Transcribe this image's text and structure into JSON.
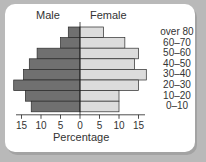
{
  "chart_data": {
    "type": "bar",
    "subtype": "population-pyramid",
    "title": "",
    "headers": {
      "left": "Male",
      "right": "Female"
    },
    "categories": [
      "over 80",
      "60–70",
      "50–60",
      "40–50",
      "30–40",
      "20–30",
      "10–20",
      "0–10"
    ],
    "series": [
      {
        "name": "Male",
        "values": [
          3,
          5,
          11,
          13,
          14.5,
          17,
          14,
          12.5
        ],
        "color": "#707070"
      },
      {
        "name": "Female",
        "values": [
          6,
          11.5,
          15,
          14,
          17,
          15,
          10,
          10
        ],
        "color": "#dcdcdc"
      }
    ],
    "xlabel": "Percentage",
    "ylabel": "",
    "xticks": [
      "15",
      "10",
      "5",
      "0",
      "5",
      "10",
      "15"
    ],
    "xlim": [
      -15,
      15
    ],
    "grid": false,
    "legend_position": "top"
  }
}
